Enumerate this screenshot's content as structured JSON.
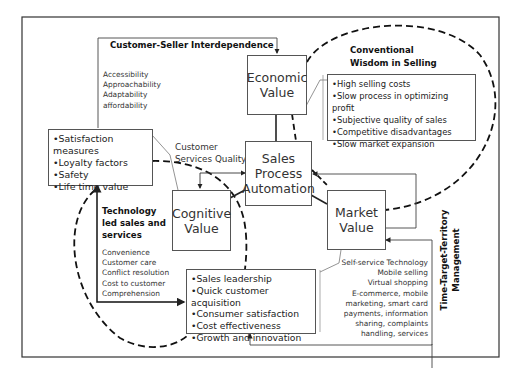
{
  "diagram": {
    "customer_seller": {
      "title": "Customer-Seller Interdependence",
      "items": [
        "Accessibility",
        "Approachability",
        "Adaptability",
        "affordability"
      ]
    },
    "conventional": {
      "title_line1": "Conventional",
      "title_line2": "Wisdom in Selling",
      "items": [
        "High selling costs",
        "Slow process in optimizing profit",
        "Subjective quality of sales",
        "Competitive disadvantages",
        "Slow market expansion"
      ]
    },
    "customer_metrics": {
      "items": [
        "Satisfaction measures",
        "Loyalty factors",
        "Safety",
        "Life time value"
      ]
    },
    "customer_services_quality": {
      "line1": "Customer",
      "line2": "Services Quality"
    },
    "nodes": {
      "economic_line1": "Economic",
      "economic_line2": "Value",
      "spa_line1": "Sales",
      "spa_line2": "Process",
      "spa_line3": "Automation",
      "cognitive_line1": "Cognitive",
      "cognitive_line2": "Value",
      "market_line1": "Market",
      "market_line2": "Value"
    },
    "technology": {
      "title_line1": "Technology",
      "title_line2": "led sales and",
      "title_line3": "services",
      "items": [
        "Convenience",
        "Customer care",
        "Conflict  resolution",
        "Cost to customer",
        "Comprehension"
      ]
    },
    "outcomes": {
      "items": [
        "Sales leadership",
        "Quick customer acquisition",
        "Consumer satisfaction",
        "Cost effectiveness",
        "Growth and innovation"
      ]
    },
    "market_tech": {
      "items": [
        "Self-service Technology",
        "Mobile  selling",
        "Virtual shopping",
        "E-commerce, mobile",
        "marketing, smart card",
        "payments, information",
        "sharing, complaints",
        "handling,  services"
      ]
    },
    "ttt": {
      "line1": "Time-Target-Territory",
      "line2": "Management"
    }
  }
}
